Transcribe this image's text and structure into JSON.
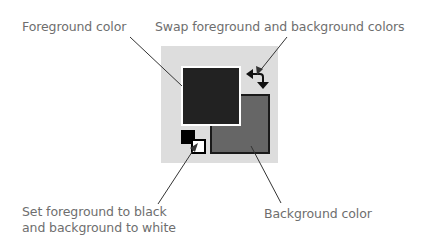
{
  "labels": {
    "foreground": "Foreground color",
    "swap": "Swap foreground and background colors",
    "default_line1": "Set foreground to black",
    "default_line2": "and background to white",
    "background": "Background color"
  },
  "colors": {
    "foreground": "#222222",
    "background": "#666666",
    "panel": "#dddddd",
    "default_foreground": "#000000",
    "default_background": "#ffffff",
    "label_text": "#6e6e6e",
    "leader_line": "#333333"
  },
  "icons": {
    "swap": "swap-arrows-icon",
    "default_colors": "default-colors-icon"
  }
}
